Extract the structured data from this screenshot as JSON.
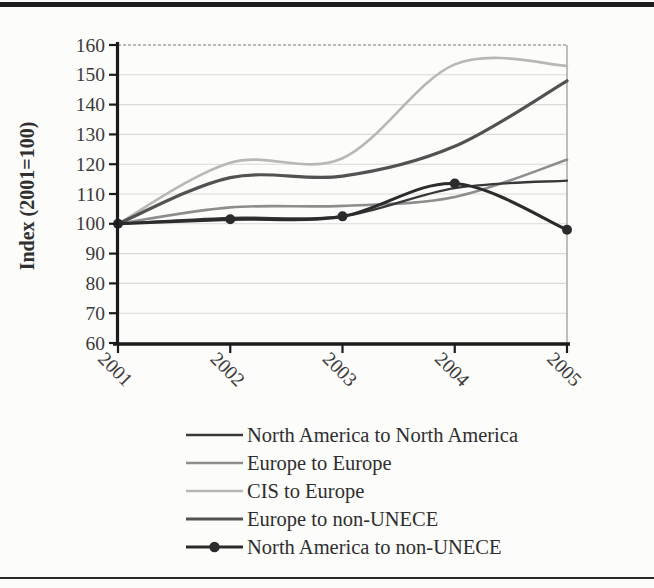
{
  "page": {
    "background": "#fcfcfa",
    "top_rule_color": "#1d1d1d",
    "bottom_rule_color": "#2a2a2a"
  },
  "chart_data": {
    "type": "line",
    "title": "",
    "ylabel": "Index (2001=100)",
    "xlabel": "",
    "x_categories": [
      "2001",
      "2002",
      "2003",
      "2004",
      "2005"
    ],
    "ylim": [
      60,
      160
    ],
    "yticks": [
      60,
      70,
      80,
      90,
      100,
      110,
      120,
      130,
      140,
      150,
      160
    ],
    "grid": true,
    "legend_position": "bottom",
    "axis_color": "#1b1b1b",
    "grid_color": "#d9d9d7",
    "plot_border_color": "#9c9c9c",
    "series": [
      {
        "name": "North America to North America",
        "values": [
          100,
          102,
          102.5,
          112,
          114.5
        ],
        "color": "#383838",
        "width": 2.3,
        "marker": false
      },
      {
        "name": "Europe to Europe",
        "values": [
          100,
          105.5,
          106,
          109,
          121.5
        ],
        "color": "#8d8d8d",
        "width": 2.6,
        "marker": false
      },
      {
        "name": "CIS to Europe",
        "values": [
          100,
          120.5,
          122,
          153.5,
          153
        ],
        "color": "#b7b7b5",
        "width": 2.6,
        "marker": false
      },
      {
        "name": "Europe to non-UNECE",
        "values": [
          100,
          115.5,
          116,
          126,
          148
        ],
        "color": "#525252",
        "width": 3.2,
        "marker": false
      },
      {
        "name": "North America to non-UNECE",
        "values": [
          100,
          101.5,
          102.5,
          113.5,
          98
        ],
        "color": "#2b2b2b",
        "width": 3.1,
        "marker": true,
        "marker_radius": 5
      }
    ]
  }
}
